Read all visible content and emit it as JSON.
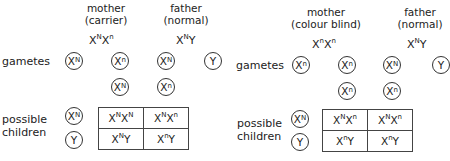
{
  "left": {
    "mother_label": "mother",
    "mother_status": "(carrier)",
    "mother_genotype": {
      "a": "X",
      "a_sup": "N",
      "b": "X",
      "b_sup": "n"
    },
    "father_label": "father",
    "father_status": "(normal)",
    "father_genotype": {
      "a": "X",
      "a_sup": "N",
      "b": "Y",
      "b_sup": ""
    },
    "gametes_label": "gametes",
    "gametes": [
      {
        "base": "X",
        "sup": "N"
      },
      {
        "base": "X",
        "sup": "n"
      },
      {
        "base": "X",
        "sup": "N"
      },
      {
        "base": "Y",
        "sup": ""
      },
      {
        "base": "X",
        "sup": "N"
      },
      {
        "base": "X",
        "sup": "n"
      }
    ],
    "children_label": [
      "possible",
      "children"
    ],
    "row_headers": [
      {
        "base": "X",
        "sup": "N"
      },
      {
        "base": "Y",
        "sup": ""
      }
    ],
    "cells": [
      [
        {
          "a": "X",
          "as": "N",
          "b": "X",
          "bs": "N"
        },
        {
          "a": "X",
          "as": "N",
          "b": "X",
          "bs": "n"
        }
      ],
      [
        {
          "a": "X",
          "as": "N",
          "b": "Y",
          "bs": ""
        },
        {
          "a": "X",
          "as": "n",
          "b": "Y",
          "bs": ""
        }
      ]
    ]
  },
  "right": {
    "mother_label": "mother",
    "mother_status": "(colour blind)",
    "mother_genotype": {
      "a": "X",
      "a_sup": "n",
      "b": "X",
      "b_sup": "n"
    },
    "father_label": "father",
    "father_status": "(normal)",
    "father_genotype": {
      "a": "X",
      "a_sup": "N",
      "b": "Y",
      "b_sup": ""
    },
    "gametes_label": "gametes",
    "gametes": [
      {
        "base": "X",
        "sup": "n"
      },
      {
        "base": "X",
        "sup": "n"
      },
      {
        "base": "X",
        "sup": "N"
      },
      {
        "base": "Y",
        "sup": ""
      },
      {
        "base": "X",
        "sup": "n"
      }
    ],
    "children_label": [
      "possible",
      "children"
    ],
    "row_headers": [
      {
        "base": "X",
        "sup": "N"
      },
      {
        "base": "Y",
        "sup": ""
      }
    ],
    "cells": [
      [
        {
          "a": "X",
          "as": "N",
          "b": "X",
          "bs": "n"
        },
        {
          "a": "X",
          "as": "N",
          "b": "X",
          "bs": "n"
        }
      ],
      [
        {
          "a": "X",
          "as": "n",
          "b": "Y",
          "bs": ""
        },
        {
          "a": "X",
          "as": "n",
          "b": "Y",
          "bs": ""
        }
      ]
    ]
  }
}
